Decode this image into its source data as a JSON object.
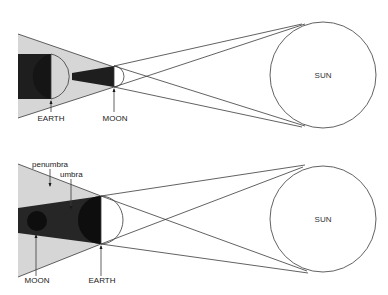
{
  "colors": {
    "background": "#ffffff",
    "penumbra": "#d6d6d6",
    "umbra": "#1e1e1e",
    "outline": "#3a3a3a"
  },
  "diagrams": [
    {
      "name": "solar-eclipse",
      "labels": {
        "earth": "EARTH",
        "moon": "MOON",
        "sun": "SUN"
      }
    },
    {
      "name": "lunar-eclipse",
      "labels": {
        "penumbra": "penumbra",
        "umbra": "umbra",
        "moon": "MOON",
        "earth": "EARTH",
        "sun": "SUN"
      }
    }
  ]
}
